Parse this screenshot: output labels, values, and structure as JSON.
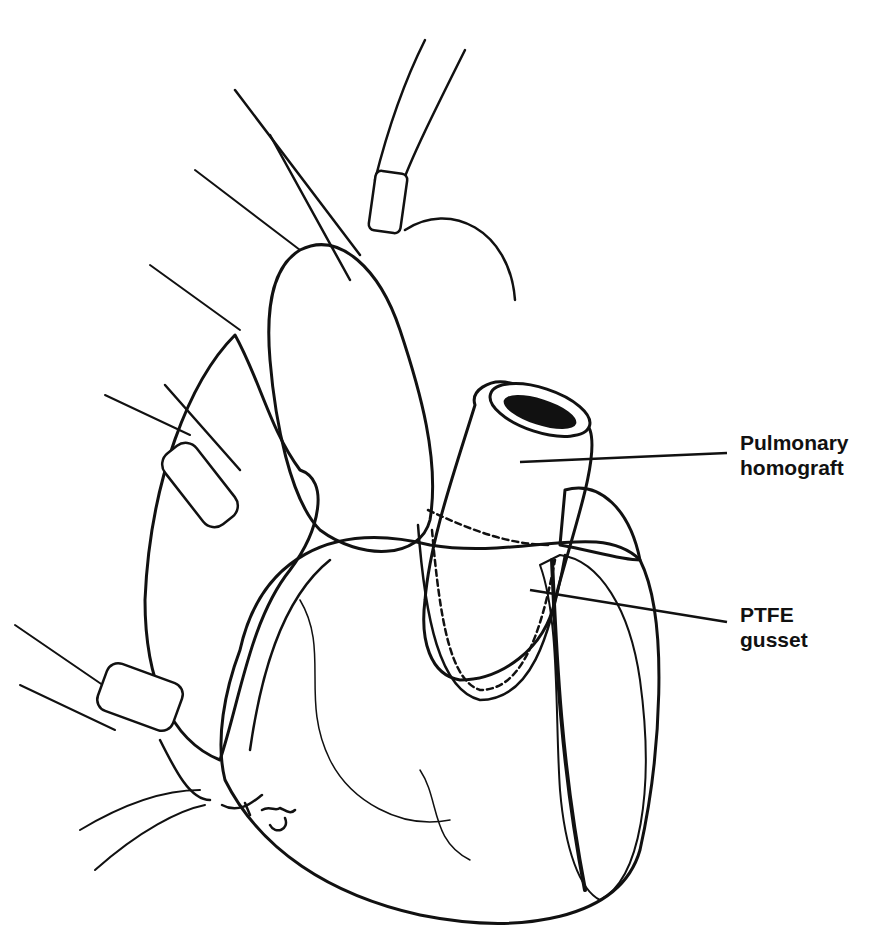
{
  "figure": {
    "colors": {
      "ink": "#111111",
      "background": "#ffffff"
    },
    "signature": "Artz",
    "labels": [
      {
        "id": "pulmonary-homograft",
        "lines": [
          "Pulmonary",
          "homograft"
        ],
        "leader": {
          "from": [
            520,
            462
          ],
          "to": [
            727,
            453
          ]
        }
      },
      {
        "id": "ptfe-gusset",
        "lines": [
          "PTFE",
          "gusset"
        ],
        "leader": {
          "from": [
            530,
            590
          ],
          "to": [
            727,
            622
          ]
        }
      }
    ]
  }
}
